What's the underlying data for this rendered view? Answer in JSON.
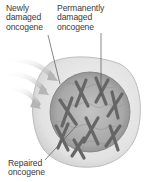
{
  "diagram": {
    "labels": {
      "newly_damaged": "Newly\ndamaged\noncogene",
      "permanently_damaged": "Permanently\ndamaged\noncogene",
      "repaired": "Repaired\noncogene"
    },
    "colors": {
      "cell_fill": "#e6e6e6",
      "cell_stroke": "#bdbdbd",
      "nucleus_fill": "#a9a9a9",
      "chromosome": "#6f6f6f",
      "arrow": "#cfcfcf",
      "leader_line": "#555555",
      "text": "#3a3a3a"
    },
    "elements": [
      "cell",
      "nucleus",
      "chromosomes",
      "incoming-arrows"
    ]
  }
}
